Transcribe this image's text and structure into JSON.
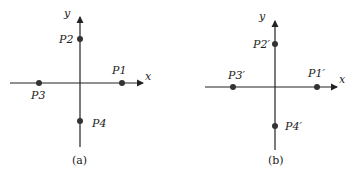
{
  "diagrams": [
    {
      "caption": "(a)",
      "x_axis_label": "x",
      "y_axis_label": "y",
      "points": [
        {
          "label": "P1",
          "position": "positive x-axis"
        },
        {
          "label": "P2",
          "position": "positive y-axis"
        },
        {
          "label": "P3",
          "position": "negative x-axis"
        },
        {
          "label": "P4",
          "position": "negative y-axis"
        }
      ]
    },
    {
      "caption": "(b)",
      "x_axis_label": "x",
      "y_axis_label": "y",
      "points": [
        {
          "label": "P1′",
          "position": "positive x-axis"
        },
        {
          "label": "P2′",
          "position": "positive y-axis"
        },
        {
          "label": "P3′",
          "position": "negative x-axis"
        },
        {
          "label": "P4′",
          "position": "negative y-axis"
        }
      ]
    }
  ],
  "colors": {
    "axis": "#222222",
    "point": "#333333"
  }
}
